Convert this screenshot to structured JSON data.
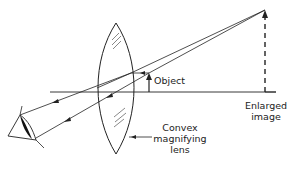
{
  "diagram": {
    "labels": {
      "object": "Object",
      "image_line1": "Enlarged",
      "image_line2": "image",
      "lens_line1": "Convex",
      "lens_line2": "magnifying",
      "lens_line3": "lens"
    },
    "colors": {
      "stroke": "#222222",
      "background": "#ffffff"
    }
  }
}
